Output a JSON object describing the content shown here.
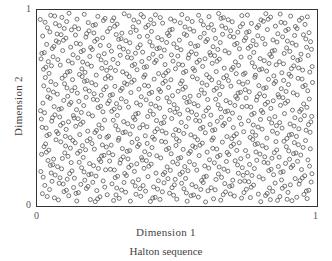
{
  "chart_data": {
    "type": "scatter",
    "title": "Halton sequence",
    "xlabel": "Dimension  1",
    "ylabel": "Dimension  2",
    "xlim": [
      0,
      1
    ],
    "ylim": [
      0,
      1
    ],
    "x_ticks": [
      "0",
      "1"
    ],
    "y_ticks": [
      "0",
      "1"
    ],
    "grid": false,
    "legend": null,
    "marker": "hollow-circle",
    "marker_color": "#555555",
    "sequence": {
      "name": "Halton",
      "bases": [
        2,
        3
      ],
      "n_points": 1000,
      "start_index": 1
    }
  },
  "labels": {
    "y_tick_top": "1",
    "y_tick_bottom": "0",
    "x_tick_left": "0",
    "x_tick_right": "1",
    "xlabel": "Dimension  1",
    "ylabel": "Dimension  2",
    "title": "Halton sequence"
  }
}
